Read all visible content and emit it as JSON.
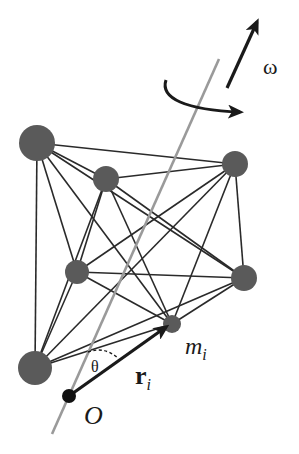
{
  "diagram": {
    "colors": {
      "background": "#ffffff",
      "node": "#5a5a5a",
      "edge": "#2a2a2a",
      "axis": "#9a9a9a",
      "vector": "#1a1a1a",
      "origin": "#111111"
    },
    "nodes": [
      {
        "id": "A",
        "x": 37,
        "y": 143,
        "r": 18
      },
      {
        "id": "B",
        "x": 106,
        "y": 179,
        "r": 13
      },
      {
        "id": "C",
        "x": 235,
        "y": 164,
        "r": 13
      },
      {
        "id": "D",
        "x": 77,
        "y": 272,
        "r": 12
      },
      {
        "id": "E",
        "x": 244,
        "y": 278,
        "r": 13
      },
      {
        "id": "F",
        "x": 172,
        "y": 324,
        "r": 9
      },
      {
        "id": "G",
        "x": 35,
        "y": 368,
        "r": 17
      }
    ],
    "origin": {
      "x": 69,
      "y": 396,
      "r": 7
    },
    "axis": {
      "x1": 52,
      "y1": 434,
      "x2": 219,
      "y2": 59
    },
    "omega_arrow": {
      "x1": 227,
      "y1": 88,
      "x2": 257,
      "y2": 22
    },
    "labels": {
      "omega": "ω",
      "mass": "m",
      "mass_sub": "i",
      "radius": "r",
      "radius_sub": "i",
      "theta": "θ",
      "origin": "O"
    }
  }
}
